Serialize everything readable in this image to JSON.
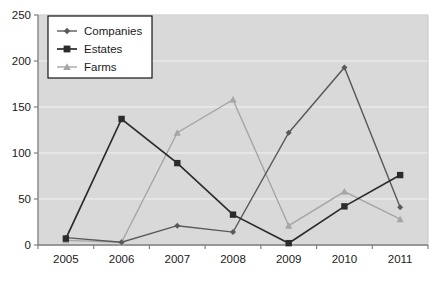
{
  "chart_data": {
    "type": "line",
    "title": "",
    "subtitle": "",
    "xlabel": "",
    "ylabel": "",
    "categories": [
      "2005",
      "2006",
      "2007",
      "2008",
      "2009",
      "2010",
      "2011"
    ],
    "series": [
      {
        "name": "Companies",
        "marker": "diamond",
        "color": "#595959",
        "values": [
          8,
          3,
          21,
          14,
          122,
          193,
          41
        ]
      },
      {
        "name": "Estates",
        "marker": "square",
        "color": "#2b2b2b",
        "values": [
          7,
          137,
          89,
          33,
          2,
          42,
          76
        ]
      },
      {
        "name": "Farms",
        "marker": "triangle",
        "color": "#a6a6a6",
        "values": [
          5,
          3,
          122,
          158,
          21,
          58,
          28
        ]
      }
    ],
    "ylim": [
      0,
      250
    ],
    "yticks": [
      0,
      50,
      100,
      150,
      200,
      250
    ],
    "ytick_labels": [
      "0",
      "50",
      "100",
      "150",
      "200",
      "250"
    ],
    "grid": true,
    "grid_axis": "y",
    "legend_position": "top-left-inside",
    "plot_background": "#d9d9d9",
    "grid_color": "#f2f2f2",
    "axis_color": "#808080",
    "page_background": "#ffffff"
  }
}
